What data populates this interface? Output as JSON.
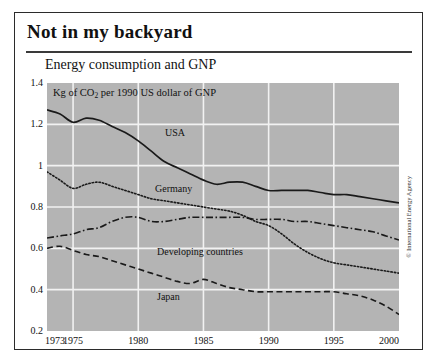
{
  "headline": "Not in my backyard",
  "subtitle": "Energy consumption and GNP",
  "unit_caption_prefix": "Kg of CO",
  "unit_caption_sub": "2",
  "unit_caption_suffix": " per 1990 US dollar of GNP",
  "credit": "© International Energy Agency",
  "colors": {
    "plot_background": "#b4b4b4",
    "gridline": "#f2f2f2",
    "line": "#1a1a1a",
    "frame": "#2b2b2b",
    "page_background": "#ffffff",
    "text": "#111111"
  },
  "labels": {
    "usa": "USA",
    "germany": "Germany",
    "developing": "Developing countries",
    "japan": "Japan"
  },
  "chart_data": {
    "type": "line",
    "title": "Not in my backyard",
    "subtitle": "Energy consumption and GNP",
    "xlabel": "",
    "ylabel": "Kg of CO2 per 1990 US dollar of GNP",
    "ylim": [
      0.2,
      1.4
    ],
    "xlim": [
      1973,
      2000
    ],
    "yticks": [
      "1.4",
      "1.2",
      "1",
      "0.8",
      "0.6",
      "0.4",
      "0.2"
    ],
    "ytick_values": [
      1.4,
      1.2,
      1,
      0.8,
      0.6,
      0.4,
      0.2
    ],
    "xticks": [
      "1973",
      "1975",
      "1980",
      "1985",
      "1990",
      "1995",
      "2000"
    ],
    "xtick_values": [
      1973,
      1975,
      1980,
      1985,
      1990,
      1995,
      2000
    ],
    "grid": true,
    "legend": "inline-labels",
    "annotation": "© International Energy Agency",
    "x": [
      1973,
      1974,
      1975,
      1976,
      1977,
      1978,
      1979,
      1980,
      1981,
      1982,
      1983,
      1984,
      1985,
      1986,
      1987,
      1988,
      1989,
      1990,
      1991,
      1992,
      1993,
      1994,
      1995,
      1996,
      1997,
      1998,
      1999,
      2000
    ],
    "series": [
      {
        "name": "USA",
        "style": "solid",
        "values": [
          1.27,
          1.25,
          1.21,
          1.23,
          1.22,
          1.19,
          1.16,
          1.12,
          1.07,
          1.02,
          0.99,
          0.96,
          0.93,
          0.91,
          0.92,
          0.92,
          0.9,
          0.88,
          0.88,
          0.88,
          0.88,
          0.87,
          0.86,
          0.86,
          0.85,
          0.84,
          0.83,
          0.82
        ]
      },
      {
        "name": "Germany",
        "style": "dotted",
        "values": [
          0.97,
          0.93,
          0.89,
          0.91,
          0.92,
          0.9,
          0.88,
          0.86,
          0.84,
          0.83,
          0.82,
          0.81,
          0.8,
          0.79,
          0.78,
          0.76,
          0.73,
          0.71,
          0.67,
          0.62,
          0.58,
          0.55,
          0.53,
          0.52,
          0.51,
          0.5,
          0.49,
          0.48
        ]
      },
      {
        "name": "Developing countries",
        "style": "dash-dot",
        "values": [
          0.65,
          0.66,
          0.67,
          0.69,
          0.7,
          0.73,
          0.75,
          0.75,
          0.73,
          0.73,
          0.74,
          0.75,
          0.75,
          0.75,
          0.75,
          0.75,
          0.74,
          0.74,
          0.74,
          0.73,
          0.73,
          0.72,
          0.71,
          0.7,
          0.69,
          0.68,
          0.66,
          0.64
        ]
      },
      {
        "name": "Japan",
        "style": "dashed",
        "values": [
          0.6,
          0.61,
          0.59,
          0.57,
          0.56,
          0.54,
          0.52,
          0.5,
          0.48,
          0.46,
          0.44,
          0.43,
          0.45,
          0.43,
          0.41,
          0.4,
          0.39,
          0.39,
          0.39,
          0.39,
          0.39,
          0.39,
          0.39,
          0.38,
          0.37,
          0.35,
          0.32,
          0.28
        ]
      }
    ]
  }
}
